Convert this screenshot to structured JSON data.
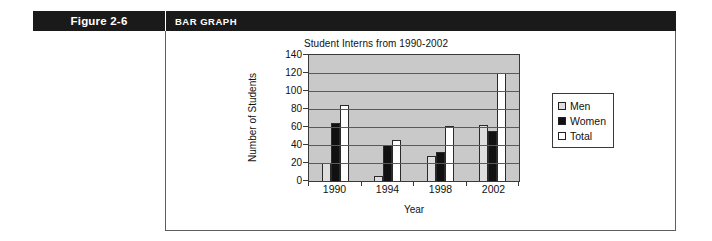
{
  "banner": {
    "figure_label": "Figure 2-6",
    "section_title": "BAR GRAPH"
  },
  "colors": {
    "banner_bg": "#1a1a1a",
    "plot_bg": "#c9c9c9",
    "men": "#dedede",
    "women": "#111111",
    "total": "#ffffff",
    "frame": "#5d5d5d"
  },
  "chart_data": {
    "type": "bar",
    "title": "Student Interns from 1990-2002",
    "xlabel": "Year",
    "ylabel": "Number of Students",
    "categories": [
      "1990",
      "1994",
      "1998",
      "2002"
    ],
    "series": [
      {
        "name": "Men",
        "color": "#dedede",
        "values": [
          20,
          6,
          28,
          62
        ]
      },
      {
        "name": "Women",
        "color": "#111111",
        "values": [
          64,
          40,
          32,
          56
        ]
      },
      {
        "name": "Total",
        "color": "#ffffff",
        "values": [
          84,
          46,
          61,
          120
        ]
      }
    ],
    "ylim": [
      0,
      140
    ],
    "yticks": [
      0,
      20,
      40,
      60,
      80,
      100,
      120,
      140
    ],
    "ytick_labels": [
      "0",
      "20",
      "40",
      "60",
      "80",
      "100",
      "120",
      "140"
    ],
    "grid": true,
    "grid_axis": "y",
    "legend": [
      "Men",
      "Women",
      "Total"
    ],
    "legend_position": "right"
  }
}
